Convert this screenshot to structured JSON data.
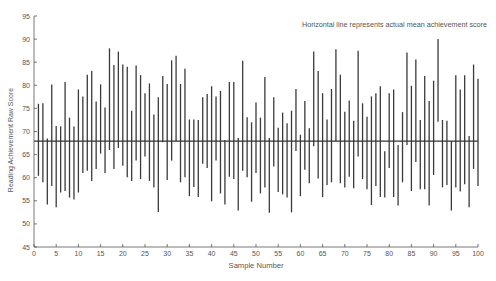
{
  "chart_data": {
    "type": "range-bar",
    "title": "",
    "annotation": "Horizontal line represents actual mean achievement score",
    "xlabel": "Sample Number",
    "ylabel": "Reading Achievement Raw Score",
    "xlim": [
      0,
      100
    ],
    "ylim": [
      45,
      95
    ],
    "x_ticks": [
      0,
      5,
      10,
      15,
      20,
      25,
      30,
      35,
      40,
      45,
      50,
      55,
      60,
      65,
      70,
      75,
      80,
      85,
      90,
      95,
      100
    ],
    "y_ticks": [
      45,
      50,
      55,
      60,
      65,
      70,
      75,
      80,
      85,
      90,
      95
    ],
    "grid": false,
    "legend": null,
    "reference_line": {
      "label": "actual mean achievement score",
      "value": 67.9
    },
    "x": [
      1,
      2,
      3,
      4,
      5,
      6,
      7,
      8,
      9,
      10,
      11,
      12,
      13,
      14,
      15,
      16,
      17,
      18,
      19,
      20,
      21,
      22,
      23,
      24,
      25,
      26,
      27,
      28,
      29,
      30,
      31,
      32,
      33,
      34,
      35,
      36,
      37,
      38,
      39,
      40,
      41,
      42,
      43,
      44,
      45,
      46,
      47,
      48,
      49,
      50,
      51,
      52,
      53,
      54,
      55,
      56,
      57,
      58,
      59,
      60,
      61,
      62,
      63,
      64,
      65,
      66,
      67,
      68,
      69,
      70,
      71,
      72,
      73,
      74,
      75,
      76,
      77,
      78,
      79,
      80,
      81,
      82,
      83,
      84,
      85,
      86,
      87,
      88,
      89,
      90,
      91,
      92,
      93,
      94,
      95,
      96,
      97,
      98,
      99,
      100
    ],
    "series": [
      {
        "name": "high",
        "values": [
          76.0,
          76.1,
          68.5,
          80.2,
          71.2,
          71.1,
          80.7,
          73.0,
          71.1,
          79.1,
          77.6,
          82.3,
          83.1,
          76.5,
          80.2,
          75.2,
          88.0,
          84.4,
          87.3,
          84.5,
          84.0,
          74.5,
          84.3,
          82.2,
          78.3,
          80.4,
          73.7,
          77.4,
          82.0,
          80.3,
          85.4,
          86.4,
          80.3,
          83.6,
          72.6,
          72.6,
          72.5,
          77.4,
          78.1,
          79.8,
          77.6,
          78.8,
          68.1,
          80.7,
          80.7,
          68.6,
          85.3,
          73.1,
          72.0,
          76.3,
          73.0,
          81.8,
          68.6,
          77.4,
          70.8,
          74.1,
          71.8,
          74.5,
          79.2,
          69.3,
          76.6,
          70.7,
          87.3,
          83.1,
          78.3,
          72.6,
          79.2,
          87.8,
          82.3,
          74.3,
          76.7,
          72.3,
          87.5,
          76.1,
          73.2,
          77.6,
          78.3,
          79.8,
          65.7,
          78.3,
          79.1,
          67.1,
          74.2,
          87.1,
          79.9,
          85.6,
          72.5,
          82.0,
          76.6,
          81.0,
          90.0,
          72.5,
          72.3,
          67.9,
          82.2,
          79.1,
          82.2,
          69.0,
          84.5,
          81.4
        ]
      },
      {
        "name": "low",
        "values": [
          60.4,
          59.0,
          54.2,
          58.2,
          53.6,
          56.8,
          57.1,
          55.7,
          55.3,
          56.8,
          61.0,
          61.5,
          59.3,
          61.9,
          65.2,
          61.0,
          66.0,
          61.9,
          66.4,
          62.6,
          60.1,
          59.3,
          63.7,
          59.7,
          64.6,
          59.3,
          57.9,
          52.6,
          67.7,
          59.5,
          63.7,
          67.9,
          59.0,
          60.1,
          56.0,
          58.0,
          55.8,
          63.0,
          62.1,
          54.9,
          63.7,
          56.6,
          54.2,
          60.2,
          59.7,
          52.9,
          61.5,
          60.1,
          54.8,
          61.0,
          56.6,
          57.9,
          52.4,
          62.4,
          56.9,
          56.4,
          55.7,
          52.5,
          65.8,
          56.0,
          61.7,
          58.8,
          66.8,
          59.8,
          55.8,
          58.4,
          59.0,
          67.9,
          58.8,
          57.9,
          60.2,
          57.7,
          64.6,
          59.7,
          57.5,
          54.1,
          58.2,
          55.8,
          55.7,
          62.1,
          55.8,
          54.0,
          59.0,
          67.1,
          57.1,
          63.4,
          57.5,
          57.5,
          54.0,
          60.6,
          72.1,
          57.9,
          58.4,
          52.9,
          57.9,
          57.0,
          58.6,
          53.6,
          61.9,
          58.2
        ]
      }
    ],
    "colors": {
      "bars": "#3a3a3a",
      "axis": "#555555",
      "mean_line": "#333333"
    }
  }
}
